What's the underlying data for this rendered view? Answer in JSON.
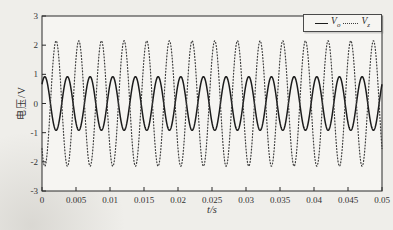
{
  "colors": {
    "paper": "#efeeea",
    "plot_background": "#f6f5f2",
    "axis": "#2b2b2b",
    "solid_series": "#1c1c1c",
    "dotted_series": "#3d3d3d",
    "legend_border": "#4a4a4a"
  },
  "chart_data": {
    "type": "line",
    "title": "",
    "xlabel": "t/s",
    "ylabel": "电压/V",
    "xlim": [
      0,
      0.05
    ],
    "ylim": [
      -3,
      3
    ],
    "xticks": [
      0,
      0.005,
      0.01,
      0.015,
      0.02,
      0.025,
      0.03,
      0.035,
      0.04,
      0.045,
      0.05
    ],
    "xtick_labels": [
      "0",
      "0.005",
      "0.01",
      "0.015",
      "0.02",
      "0.025",
      "0.03",
      "0.035",
      "0.04",
      "0.045",
      "0.05"
    ],
    "yticks": [
      -3,
      -2,
      -1,
      0,
      1,
      2,
      3
    ],
    "ytick_labels": [
      "-3",
      "-2",
      "-1",
      "0",
      "1",
      "2",
      "3"
    ],
    "grid": false,
    "legend_position": "top-right-inside",
    "series": [
      {
        "label_base": "V",
        "label_sub": "o",
        "line_style": "solid",
        "waveform": "sine",
        "amplitude_v": 0.92,
        "frequency_hz": 300,
        "phase_rad": 0.8,
        "cycles_shown": 15
      },
      {
        "label_base": "V",
        "label_sub": "z",
        "line_style": "dotted",
        "waveform": "sine",
        "amplitude_v": 2.15,
        "frequency_hz": 300,
        "phase_rad": 3.9416,
        "cycles_shown": 15
      }
    ]
  }
}
